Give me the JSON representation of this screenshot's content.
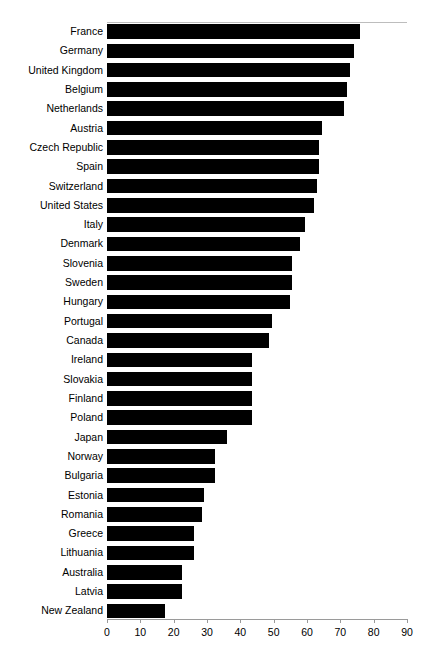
{
  "chart_data": {
    "type": "bar",
    "orientation": "horizontal",
    "title": "",
    "subtitle": "",
    "xlabel": "",
    "ylabel": "",
    "xlim": [
      0,
      90
    ],
    "xticks": [
      0,
      10,
      20,
      30,
      40,
      50,
      60,
      70,
      80,
      90
    ],
    "grid": false,
    "legend": null,
    "bar_color": "#000000",
    "axis_color": "#9a9a9a",
    "categories": [
      "France",
      "Germany",
      "United Kingdom",
      "Belgium",
      "Netherlands",
      "Austria",
      "Czech Republic",
      "Spain",
      "Switzerland",
      "United States",
      "Italy",
      "Denmark",
      "Slovenia",
      "Sweden",
      "Hungary",
      "Portugal",
      "Canada",
      "Ireland",
      "Slovakia",
      "Finland",
      "Poland",
      "Japan",
      "Norway",
      "Bulgaria",
      "Estonia",
      "Romania",
      "Greece",
      "Lithuania",
      "Australia",
      "Latvia",
      "New Zealand"
    ],
    "values": [
      76,
      74,
      73,
      72,
      71,
      64.5,
      63.5,
      63.5,
      63,
      62,
      59.5,
      58,
      55.5,
      55.5,
      55,
      49.5,
      48.5,
      43.5,
      43.5,
      43.5,
      43.5,
      36,
      32.5,
      32.5,
      29,
      28.5,
      26,
      26,
      22.5,
      22.5,
      17.5
    ]
  }
}
